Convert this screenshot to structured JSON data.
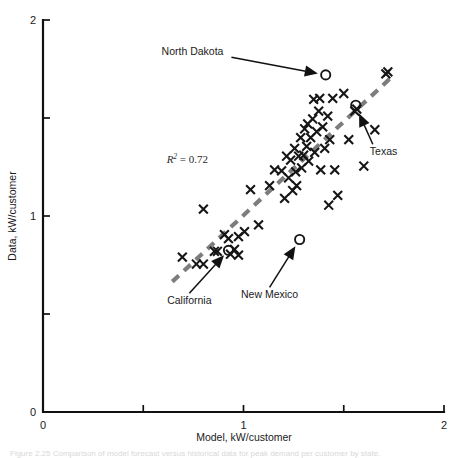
{
  "figure": {
    "caption": "Figure 2.25  Comparison of model forecast versus historical data for peak demand per customer by state.",
    "caption_visible": false
  },
  "chart_data": {
    "type": "scatter",
    "title": "",
    "xlabel": "Model, kW/customer",
    "ylabel": "Data, kW/customer",
    "xlim": [
      0,
      2
    ],
    "ylim": [
      0,
      2
    ],
    "xticks": [
      0,
      0.5,
      1,
      1.5,
      2
    ],
    "xtick_labels": [
      "0",
      "",
      "1",
      "",
      "2"
    ],
    "yticks": [
      0,
      0.5,
      1,
      1.5,
      2
    ],
    "ytick_labels": [
      "0",
      "",
      "1",
      "",
      "2"
    ],
    "grid": false,
    "legend": "none",
    "annotations": [
      {
        "name": "r-squared",
        "text": "R",
        "superscript": "2",
        "suffix": " = 0.72",
        "x": 0.72,
        "y": 1.27
      },
      {
        "name": "north-dakota",
        "label": "North Dakota",
        "label_x": 0.9,
        "label_y": 1.82,
        "point_x": 1.41,
        "point_y": 1.72
      },
      {
        "name": "texas",
        "label": "Texas",
        "label_x": 1.63,
        "label_y": 1.31,
        "point_x": 1.56,
        "point_y": 1.56
      },
      {
        "name": "california",
        "label": "California",
        "label_x": 0.73,
        "label_y": 0.55,
        "point_x": 0.93,
        "point_y": 0.83
      },
      {
        "name": "new-mexico",
        "label": "New Mexico",
        "label_x": 1.13,
        "label_y": 0.58,
        "point_x": 1.28,
        "point_y": 0.88
      }
    ],
    "trendline": {
      "style": "dashed",
      "color": "#7d7d7d",
      "x0": 0.645,
      "y0": 0.665,
      "x1": 1.745,
      "y1": 1.715
    },
    "series": [
      {
        "name": "States (x markers)",
        "marker": "x",
        "points": [
          [
            0.695,
            0.79
          ],
          [
            0.765,
            0.755
          ],
          [
            0.8,
            0.755
          ],
          [
            0.8,
            1.035
          ],
          [
            0.855,
            0.82
          ],
          [
            0.87,
            0.82
          ],
          [
            0.905,
            0.905
          ],
          [
            0.925,
            0.885
          ],
          [
            0.935,
            0.805
          ],
          [
            0.955,
            0.83
          ],
          [
            0.975,
            0.8
          ],
          [
            0.975,
            0.895
          ],
          [
            1.005,
            0.92
          ],
          [
            1.035,
            1.135
          ],
          [
            1.075,
            0.955
          ],
          [
            1.13,
            1.155
          ],
          [
            1.155,
            1.235
          ],
          [
            1.19,
            1.23
          ],
          [
            1.205,
            1.09
          ],
          [
            1.215,
            1.305
          ],
          [
            1.225,
            1.195
          ],
          [
            1.235,
            1.285
          ],
          [
            1.245,
            1.13
          ],
          [
            1.255,
            1.345
          ],
          [
            1.26,
            1.225
          ],
          [
            1.265,
            1.155
          ],
          [
            1.275,
            1.305
          ],
          [
            1.285,
            1.4
          ],
          [
            1.29,
            1.245
          ],
          [
            1.3,
            1.31
          ],
          [
            1.305,
            1.445
          ],
          [
            1.315,
            1.355
          ],
          [
            1.32,
            1.47
          ],
          [
            1.325,
            1.28
          ],
          [
            1.335,
            1.4
          ],
          [
            1.345,
            1.495
          ],
          [
            1.35,
            1.595
          ],
          [
            1.355,
            1.325
          ],
          [
            1.365,
            1.43
          ],
          [
            1.375,
            1.535
          ],
          [
            1.38,
            1.6
          ],
          [
            1.385,
            1.235
          ],
          [
            1.395,
            1.455
          ],
          [
            1.405,
            1.345
          ],
          [
            1.42,
            1.51
          ],
          [
            1.425,
            1.055
          ],
          [
            1.43,
            1.39
          ],
          [
            1.445,
            1.6
          ],
          [
            1.455,
            1.235
          ],
          [
            1.47,
            1.105
          ],
          [
            1.5,
            1.625
          ],
          [
            1.525,
            1.39
          ],
          [
            1.555,
            1.535
          ],
          [
            1.565,
            1.545
          ],
          [
            1.6,
            1.255
          ],
          [
            1.655,
            1.44
          ],
          [
            1.71,
            1.725
          ],
          [
            1.72,
            1.735
          ]
        ]
      },
      {
        "name": "Highlighted states (o markers)",
        "marker": "o",
        "points": [
          [
            1.41,
            1.72
          ],
          [
            1.56,
            1.565
          ],
          [
            0.925,
            0.825
          ],
          [
            1.28,
            0.88
          ]
        ]
      }
    ]
  }
}
